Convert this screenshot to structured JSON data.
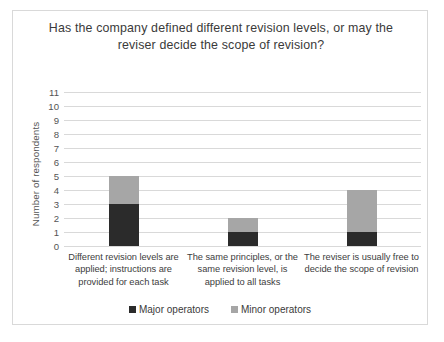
{
  "chart_data": {
    "type": "bar",
    "subtype": "stacked-bar",
    "title": "Has the company defined different revision levels, or may the reviser decide the scope of revision?",
    "xlabel": "",
    "ylabel": "Number of respondents",
    "ylim": [
      0,
      11
    ],
    "yticks": [
      0,
      1,
      2,
      3,
      4,
      5,
      6,
      7,
      8,
      9,
      10,
      11
    ],
    "grid": true,
    "legend_position": "bottom",
    "categories": [
      "Different revision levels are applied; instructions are provided for each task",
      "The same principles, or the same revision level, is applied to all tasks",
      "The reviser is usually free to decide the scope of revision"
    ],
    "series": [
      {
        "name": "Major operators",
        "values": [
          3,
          1,
          1
        ],
        "color": "#2b2b2b"
      },
      {
        "name": "Minor operators",
        "values": [
          2,
          1,
          3
        ],
        "color": "#a6a6a6"
      }
    ],
    "totals": [
      5,
      2,
      4
    ]
  }
}
